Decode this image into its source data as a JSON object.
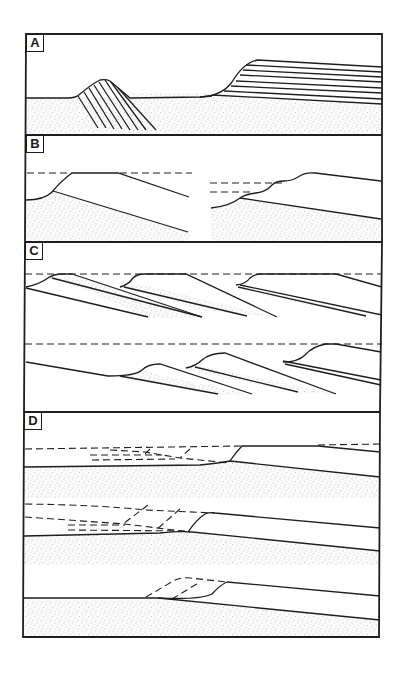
{
  "figure": {
    "type": "geological cross-section diagram",
    "panels": [
      {
        "label": "A",
        "description": "Dune with inclined cross-bedding on sand, and terrace with horizontal layered beds on sand"
      },
      {
        "label": "B",
        "description": "Two coastal profiles with dashed water levels over stippled sand wedges"
      },
      {
        "label": "C",
        "description": "Stacked prograding/retrograding wedge sequences with dashed sea levels"
      },
      {
        "label": "D",
        "description": "Three profiles with dashed former surfaces over stippled substrate"
      }
    ]
  },
  "colors": {
    "line": "#1e1e1e",
    "background": "#ffffff",
    "stipple": "#8a8a8a"
  }
}
